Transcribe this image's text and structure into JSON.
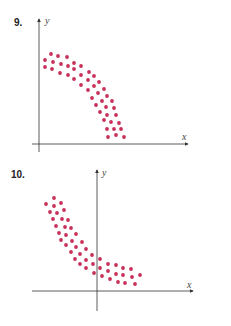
{
  "colors": {
    "dots": "#c8305a",
    "axes": "#333333"
  },
  "chart_data": [
    {
      "type": "scatter",
      "label": "9.",
      "xlabel": "x",
      "ylabel": "y",
      "grid": false,
      "description": "Band of points curving downward (concave-down), decreasing in x",
      "points_px": [
        [
          51,
          54
        ],
        [
          58,
          56
        ],
        [
          67,
          57
        ],
        [
          45,
          60
        ],
        [
          53,
          62
        ],
        [
          61,
          64
        ],
        [
          68,
          66
        ],
        [
          74,
          63
        ],
        [
          81,
          66
        ],
        [
          45,
          67
        ],
        [
          52,
          69
        ],
        [
          60,
          73
        ],
        [
          68,
          75
        ],
        [
          74,
          69
        ],
        [
          81,
          75
        ],
        [
          74,
          79
        ],
        [
          89,
          72
        ],
        [
          94,
          76
        ],
        [
          81,
          85
        ],
        [
          88,
          80
        ],
        [
          99,
          82
        ],
        [
          88,
          90
        ],
        [
          94,
          86
        ],
        [
          104,
          89
        ],
        [
          92,
          98
        ],
        [
          98,
          93
        ],
        [
          107,
          96
        ],
        [
          112,
          101
        ],
        [
          96,
          105
        ],
        [
          102,
          101
        ],
        [
          106,
          107
        ],
        [
          114,
          108
        ],
        [
          100,
          112
        ],
        [
          107,
          115
        ],
        [
          116,
          115
        ],
        [
          104,
          120
        ],
        [
          111,
          122
        ],
        [
          119,
          123
        ],
        [
          107,
          129
        ],
        [
          114,
          129
        ],
        [
          121,
          129
        ],
        [
          108,
          137
        ],
        [
          116,
          135
        ],
        [
          124,
          137
        ]
      ]
    },
    {
      "type": "scatter",
      "label": "10.",
      "xlabel": "x",
      "ylabel": "y",
      "grid": false,
      "description": "Band of points decreasing and leveling off (concave-up), crossing the y-axis",
      "points_px": [
        [
          54,
          198
        ],
        [
          46,
          204
        ],
        [
          61,
          203
        ],
        [
          54,
          206
        ],
        [
          50,
          212
        ],
        [
          57,
          213
        ],
        [
          64,
          210
        ],
        [
          53,
          219
        ],
        [
          62,
          219
        ],
        [
          68,
          220
        ],
        [
          56,
          226
        ],
        [
          65,
          227
        ],
        [
          71,
          228
        ],
        [
          59,
          233
        ],
        [
          66,
          235
        ],
        [
          76,
          234
        ],
        [
          61,
          240
        ],
        [
          72,
          241
        ],
        [
          82,
          242
        ],
        [
          66,
          245
        ],
        [
          76,
          247
        ],
        [
          86,
          249
        ],
        [
          71,
          252
        ],
        [
          80,
          254
        ],
        [
          92,
          255
        ],
        [
          75,
          259
        ],
        [
          86,
          260
        ],
        [
          100,
          259
        ],
        [
          80,
          264
        ],
        [
          93,
          264
        ],
        [
          108,
          264
        ],
        [
          116,
          265
        ],
        [
          123,
          268
        ],
        [
          131,
          269
        ],
        [
          86,
          268
        ],
        [
          100,
          268
        ],
        [
          108,
          271
        ],
        [
          94,
          273
        ],
        [
          102,
          276
        ],
        [
          116,
          274
        ],
        [
          123,
          275
        ],
        [
          140,
          275
        ],
        [
          132,
          277
        ],
        [
          110,
          279
        ],
        [
          118,
          282
        ],
        [
          125,
          283
        ],
        [
          135,
          284
        ]
      ]
    }
  ]
}
